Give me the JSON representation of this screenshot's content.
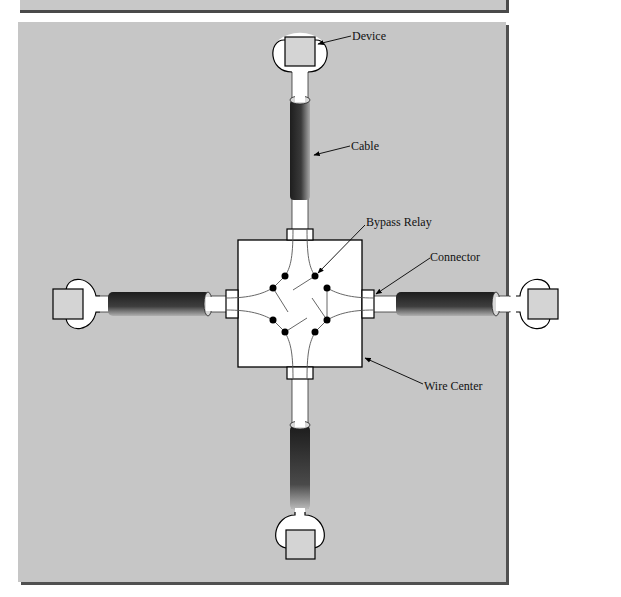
{
  "figure": {
    "type": "star-topology wiring diagram",
    "labels": {
      "device": "Device",
      "cable": "Cable",
      "bypass_relay": "Bypass Relay",
      "connector": "Connector",
      "wire_center": "Wire Center"
    }
  },
  "colors": {
    "panel_background": "#c6c6c6",
    "panel_shadow": "#505050",
    "wire_center_fill": "#ffffff",
    "device_fill": "#d4d4d4",
    "cable_dark": "#2a2a2a",
    "cable_light": "#9a9a9a",
    "relay_contact": "#000000"
  },
  "devices": [
    {
      "position": "top"
    },
    {
      "position": "right"
    },
    {
      "position": "bottom"
    },
    {
      "position": "left"
    }
  ]
}
